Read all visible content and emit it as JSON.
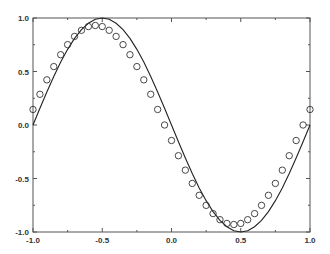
{
  "chart_data": {
    "type": "line",
    "title": "",
    "xlabel": "",
    "ylabel": "",
    "xlim": [
      -1.0,
      1.0
    ],
    "ylim": [
      -1.0,
      1.0
    ],
    "grid": false,
    "legend": "none",
    "x_ticks": [
      -1.0,
      -0.5,
      0.0,
      0.5,
      1.0
    ],
    "x_tick_labels": [
      "-1.0",
      "-0.5",
      "0.0",
      "0.5",
      "1.0"
    ],
    "y_ticks": [
      1.0,
      0.5,
      0.0,
      -0.5,
      -1.0
    ],
    "y_tick_labels": [
      "1.0",
      "0.5",
      "0.0",
      "-0.5",
      "-1.0"
    ],
    "minor_tick_step": 0.25,
    "series": [
      {
        "name": "curve",
        "style": "solid-line",
        "color": "#222222",
        "function": "-sin(pi*x)",
        "x": [
          -1.0,
          -0.95,
          -0.9,
          -0.85,
          -0.8,
          -0.75,
          -0.7,
          -0.65,
          -0.6,
          -0.55,
          -0.5,
          -0.45,
          -0.4,
          -0.35,
          -0.3,
          -0.25,
          -0.2,
          -0.15,
          -0.1,
          -0.05,
          0.0,
          0.05,
          0.1,
          0.15,
          0.2,
          0.25,
          0.3,
          0.35,
          0.4,
          0.45,
          0.5,
          0.55,
          0.6,
          0.65,
          0.7,
          0.75,
          0.8,
          0.85,
          0.9,
          0.95,
          1.0
        ],
        "y": [
          0.0,
          0.156,
          0.309,
          0.454,
          0.588,
          0.707,
          0.809,
          0.891,
          0.951,
          0.988,
          1.0,
          0.988,
          0.951,
          0.891,
          0.809,
          0.707,
          0.588,
          0.454,
          0.309,
          0.156,
          0.0,
          -0.156,
          -0.309,
          -0.454,
          -0.588,
          -0.707,
          -0.809,
          -0.891,
          -0.951,
          -0.988,
          -1.0,
          -0.988,
          -0.951,
          -0.891,
          -0.809,
          -0.707,
          -0.588,
          -0.454,
          -0.309,
          -0.156,
          0.0
        ]
      },
      {
        "name": "samples",
        "style": "open-circle-markers",
        "color": "#333333",
        "x": [
          -1.0,
          -0.95,
          -0.9,
          -0.85,
          -0.8,
          -0.75,
          -0.7,
          -0.65,
          -0.6,
          -0.55,
          -0.5,
          -0.45,
          -0.4,
          -0.35,
          -0.3,
          -0.25,
          -0.2,
          -0.15,
          -0.1,
          -0.05,
          0.0,
          0.05,
          0.1,
          0.15,
          0.2,
          0.25,
          0.3,
          0.35,
          0.4,
          0.45,
          0.5,
          0.55,
          0.6,
          0.65,
          0.7,
          0.75,
          0.8,
          0.85,
          0.9,
          0.95,
          1.0
        ],
        "y": [
          0.145,
          0.287,
          0.422,
          0.546,
          0.657,
          0.751,
          0.828,
          0.885,
          0.92,
          0.93,
          0.92,
          0.885,
          0.828,
          0.751,
          0.657,
          0.546,
          0.422,
          0.287,
          0.145,
          0.0,
          -0.145,
          -0.287,
          -0.422,
          -0.546,
          -0.657,
          -0.751,
          -0.828,
          -0.885,
          -0.92,
          -0.93,
          -0.92,
          -0.885,
          -0.828,
          -0.751,
          -0.657,
          -0.546,
          -0.422,
          -0.287,
          -0.145,
          0.0,
          0.145
        ]
      }
    ]
  }
}
